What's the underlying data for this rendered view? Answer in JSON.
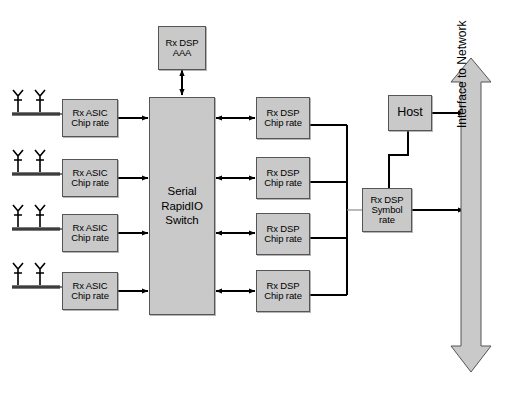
{
  "figure": {
    "caption": "",
    "colors": {
      "box_fill": "#c9c9c9",
      "box_border": "#555555",
      "line": "#000000",
      "arrow_fill": "#c9c9c9",
      "antenna_base": "#7a7a7a"
    }
  },
  "antennas": [
    {
      "label": "antenna-pair-1"
    },
    {
      "label": "antenna-pair-2"
    },
    {
      "label": "antenna-pair-3"
    },
    {
      "label": "antenna-pair-4"
    }
  ],
  "asic_blocks": [
    {
      "line1": "Rx ASIC",
      "line2": "Chip rate"
    },
    {
      "line1": "Rx ASIC",
      "line2": "Chip rate"
    },
    {
      "line1": "Rx ASIC",
      "line2": "Chip rate"
    },
    {
      "line1": "Rx ASIC",
      "line2": "Chip rate"
    }
  ],
  "switch_block": {
    "line1": "Serial",
    "line2": "RapidIO",
    "line3": "Switch"
  },
  "aaa_block": {
    "line1": "Rx DSP",
    "line2": "AAA"
  },
  "dsp_blocks": [
    {
      "line1": "Rx DSP",
      "line2": "Chip rate"
    },
    {
      "line1": "Rx DSP",
      "line2": "Chip rate"
    },
    {
      "line1": "Rx DSP",
      "line2": "Chip rate"
    },
    {
      "line1": "Rx DSP",
      "line2": "Chip rate"
    }
  ],
  "symbol_block": {
    "line1": "Rx DSP",
    "line2": "Symbol",
    "line3": "rate"
  },
  "host_block": {
    "label": "Host"
  },
  "network_arrow": {
    "label": "Interface to Network"
  }
}
